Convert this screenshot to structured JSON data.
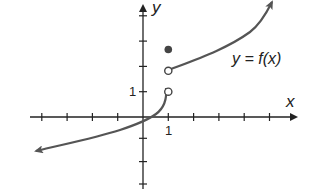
{
  "axes": {
    "x_label": "x",
    "y_label": "y",
    "x_tick_label": "1",
    "y_tick_label": "1",
    "x_range": [
      -4,
      5
    ],
    "y_range": [
      -3,
      4
    ]
  },
  "function_label": "y = f(x)",
  "points": {
    "filled": [
      {
        "x": 1,
        "y": 3
      }
    ],
    "open": [
      {
        "x": 1,
        "y": 1
      },
      {
        "x": 1,
        "y": 2
      }
    ]
  },
  "pieces": [
    {
      "name": "left-branch",
      "domain": "x < 1",
      "description": "increasing curve from lower-left arrow, passing near (0, -0.4), rising steeply to open circle at (1, 1)"
    },
    {
      "name": "right-branch",
      "domain": "x > 1",
      "description": "increasing curve from open circle at (1, 2) upward to the upper-right arrow"
    }
  ],
  "colors": {
    "axis": "#222222",
    "curve": "#555555",
    "dot": "#444444"
  }
}
